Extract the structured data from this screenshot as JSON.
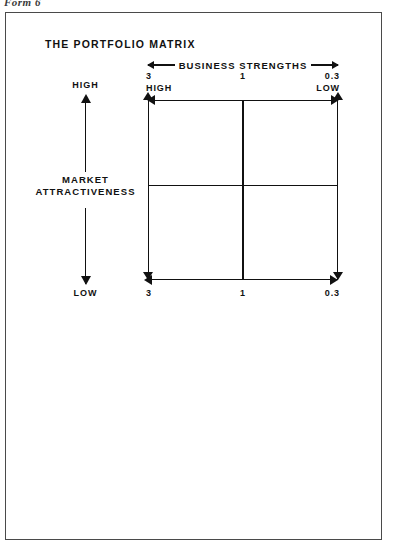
{
  "page": {
    "form_caption": "Form 6",
    "background_color": "#ffffff",
    "border_color": "#4a4a4a",
    "ink_color": "#111111"
  },
  "figure": {
    "title": "THE PORTFOLIO MATRIX",
    "horizontal_axis": {
      "label": "BUSINESS STRENGTHS",
      "arrow_style": "double-headed",
      "top_scale": [
        {
          "number": "3",
          "word": "HIGH"
        },
        {
          "number": "1",
          "word": ""
        },
        {
          "number": "0.3",
          "word": "LOW"
        }
      ],
      "bottom_scale": [
        {
          "number": "3",
          "word": ""
        },
        {
          "number": "1",
          "word": ""
        },
        {
          "number": "0.3",
          "word": ""
        }
      ]
    },
    "vertical_axis": {
      "label_line_1": "MARKET",
      "label_line_2": "ATTRACTIVENESS",
      "top_word": "HIGH",
      "bottom_word": "LOW",
      "arrow_style": "double-headed"
    },
    "matrix": {
      "rows": 2,
      "columns": 2,
      "quadrants": [
        {
          "position": "top-left",
          "label": ""
        },
        {
          "position": "top-right",
          "label": ""
        },
        {
          "position": "bottom-left",
          "label": ""
        },
        {
          "position": "bottom-right",
          "label": ""
        }
      ]
    }
  },
  "chart_data": {
    "type": "table",
    "title": "THE PORTFOLIO MATRIX",
    "xlabel": "BUSINESS STRENGTHS",
    "ylabel": "MARKET ATTRACTIVENESS",
    "grid": true,
    "legend": "none",
    "x_tick_labels": [
      "3",
      "1",
      "0.3"
    ],
    "x_tick_words": [
      "HIGH",
      "",
      "LOW"
    ],
    "x_bottom_tick_labels": [
      "3",
      "1",
      "0.3"
    ],
    "y_tick_words": [
      "HIGH",
      "LOW"
    ],
    "x_direction": "decreasing left-to-right (3 high to 0.3 low)",
    "y_direction": "decreasing top-to-bottom (high to low)",
    "categories": [
      "top-left",
      "top-right",
      "bottom-left",
      "bottom-right"
    ],
    "values": [
      null,
      null,
      null,
      null
    ],
    "cells_empty": true
  }
}
